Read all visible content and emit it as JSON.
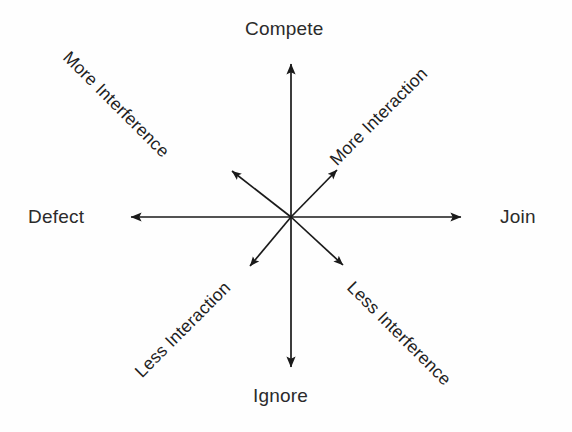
{
  "diagram": {
    "type": "radial-axis-diagram",
    "background_color": "#fefefe",
    "line_color": "#1a1a1a",
    "text_color": "#2b2b2b",
    "center": {
      "x": 291,
      "y": 217
    },
    "cardinal_labels": {
      "north": "Compete",
      "south": "Ignore",
      "west": "Defect",
      "east": "Join"
    },
    "diagonal_labels": {
      "northwest": "More Interference",
      "northeast": "More Interaction",
      "southwest": "Less Interaction",
      "southeast": "Less Interference"
    },
    "axes": [
      {
        "name": "north-axis",
        "label": "Compete",
        "direction": "up",
        "tip": {
          "x": 291,
          "y": 57
        }
      },
      {
        "name": "south-axis",
        "label": "Ignore",
        "direction": "down",
        "tip": {
          "x": 291,
          "y": 375
        }
      },
      {
        "name": "west-axis",
        "label": "Defect",
        "direction": "left",
        "tip": {
          "x": 122,
          "y": 217
        }
      },
      {
        "name": "east-axis",
        "label": "Join",
        "direction": "right",
        "tip": {
          "x": 470,
          "y": 217
        }
      },
      {
        "name": "northwest-axis",
        "label": "More Interference",
        "direction": "up-left",
        "tip": {
          "x": 225,
          "y": 164
        }
      },
      {
        "name": "northeast-axis",
        "label": "More Interaction",
        "direction": "up-right",
        "tip": {
          "x": 330,
          "y": 163
        }
      },
      {
        "name": "southwest-axis",
        "label": "Less Interaction",
        "direction": "down-left",
        "tip": {
          "x": 243,
          "y": 273
        }
      },
      {
        "name": "southeast-axis",
        "label": "Less Interference",
        "direction": "down-right",
        "tip": {
          "x": 350,
          "y": 272
        }
      }
    ]
  }
}
